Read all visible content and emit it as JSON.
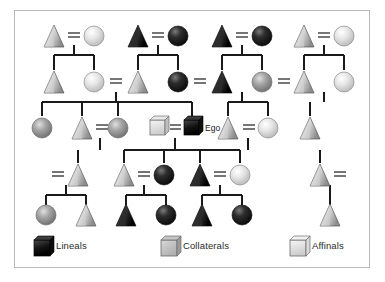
{
  "diagram": {
    "ego_label": "Ego",
    "frame": {
      "border_color": "#b9b9bd",
      "background": "#ffffff"
    },
    "palette": {
      "lineal": "#141414",
      "collateral": "#9a9a9a",
      "affinal": "#e2e2e2",
      "line": "#1a1a1a"
    },
    "symbols": {
      "male": "triangle",
      "female": "circle",
      "ego": "square"
    },
    "marriage_symbol": "=",
    "generations": [
      {
        "name": "generation-1",
        "y": 36,
        "nodes": [
          {
            "id": "g1-m1",
            "shape": "triangle",
            "fill": "collateral",
            "x": 54
          },
          {
            "id": "g1-f1",
            "shape": "circle",
            "fill": "affinal",
            "x": 94
          },
          {
            "id": "g1-m2",
            "shape": "triangle",
            "fill": "lineal",
            "x": 138
          },
          {
            "id": "g1-f2",
            "shape": "circle",
            "fill": "lineal",
            "x": 178
          },
          {
            "id": "g1-m3",
            "shape": "triangle",
            "fill": "lineal",
            "x": 222
          },
          {
            "id": "g1-f3",
            "shape": "circle",
            "fill": "lineal",
            "x": 262
          },
          {
            "id": "g1-m4",
            "shape": "triangle",
            "fill": "collateral",
            "x": 304
          },
          {
            "id": "g1-f4",
            "shape": "circle",
            "fill": "affinal",
            "x": 344
          }
        ],
        "marriages": [
          {
            "left": "g1-m1",
            "right": "g1-f1"
          },
          {
            "left": "g1-m2",
            "right": "g1-f2"
          },
          {
            "left": "g1-m3",
            "right": "g1-f3"
          },
          {
            "left": "g1-m4",
            "right": "g1-f4"
          }
        ]
      },
      {
        "name": "generation-2",
        "y": 82,
        "nodes": [
          {
            "id": "g2-m1",
            "shape": "triangle",
            "fill": "collateral",
            "x": 54
          },
          {
            "id": "g2-f1",
            "shape": "circle",
            "fill": "affinal",
            "x": 94
          },
          {
            "id": "g2-m2",
            "shape": "triangle",
            "fill": "collateral",
            "x": 138
          },
          {
            "id": "g2-f2",
            "shape": "circle",
            "fill": "lineal",
            "x": 178
          },
          {
            "id": "g2-m3",
            "shape": "triangle",
            "fill": "lineal",
            "x": 222
          },
          {
            "id": "g2-f3",
            "shape": "circle",
            "fill": "collateral",
            "x": 262
          },
          {
            "id": "g2-m4",
            "shape": "triangle",
            "fill": "collateral",
            "x": 304
          },
          {
            "id": "g2-f4",
            "shape": "circle",
            "fill": "affinal",
            "x": 344
          }
        ],
        "marriages": [
          {
            "left": "g2-f1",
            "right": "g2-m2"
          },
          {
            "left": "g2-f2",
            "right": "g2-m3"
          },
          {
            "left": "g2-f3",
            "right": "g2-m4"
          }
        ]
      },
      {
        "name": "generation-3",
        "y": 128,
        "nodes": [
          {
            "id": "g3-f1",
            "shape": "circle",
            "fill": "collateral",
            "x": 42
          },
          {
            "id": "g3-m1",
            "shape": "triangle",
            "fill": "collateral",
            "x": 82
          },
          {
            "id": "g3-f2",
            "shape": "circle",
            "fill": "collateral",
            "x": 118
          },
          {
            "id": "g3-spouse",
            "shape": "square",
            "fill": "affinal",
            "x": 158
          },
          {
            "id": "g3-ego",
            "shape": "square",
            "fill": "lineal",
            "x": 192
          },
          {
            "id": "g3-m2",
            "shape": "triangle",
            "fill": "collateral",
            "x": 228
          },
          {
            "id": "g3-f3",
            "shape": "circle",
            "fill": "affinal",
            "x": 268
          },
          {
            "id": "g3-m3",
            "shape": "triangle",
            "fill": "collateral",
            "x": 310
          }
        ],
        "marriages": [
          {
            "left": "g3-m1",
            "right": "g3-f2"
          },
          {
            "left": "g3-spouse",
            "right": "g3-ego"
          },
          {
            "left": "g3-m2",
            "right": "g3-f3"
          }
        ]
      },
      {
        "name": "generation-4",
        "y": 175,
        "nodes": [
          {
            "id": "g4-m1",
            "shape": "triangle",
            "fill": "collateral",
            "x": 78
          },
          {
            "id": "g4-m2",
            "shape": "triangle",
            "fill": "collateral",
            "x": 124
          },
          {
            "id": "g4-f1",
            "shape": "circle",
            "fill": "lineal",
            "x": 164
          },
          {
            "id": "g4-m3",
            "shape": "triangle",
            "fill": "lineal",
            "x": 200
          },
          {
            "id": "g4-f2",
            "shape": "circle",
            "fill": "affinal",
            "x": 240
          },
          {
            "id": "g4-m4",
            "shape": "triangle",
            "fill": "collateral",
            "x": 320
          }
        ],
        "marriages": [
          {
            "left": "g4-m1",
            "right": "g4-m1"
          },
          {
            "left": "g4-m2",
            "right": "g4-f1"
          },
          {
            "left": "g4-m3",
            "right": "g4-f2"
          }
        ]
      },
      {
        "name": "generation-5",
        "y": 215,
        "nodes": [
          {
            "id": "g5-f1",
            "shape": "circle",
            "fill": "collateral",
            "x": 46
          },
          {
            "id": "g5-m1",
            "shape": "triangle",
            "fill": "collateral",
            "x": 86
          },
          {
            "id": "g5-m2",
            "shape": "triangle",
            "fill": "lineal",
            "x": 126
          },
          {
            "id": "g5-f2",
            "shape": "circle",
            "fill": "lineal",
            "x": 166
          },
          {
            "id": "g5-m3",
            "shape": "triangle",
            "fill": "lineal",
            "x": 202
          },
          {
            "id": "g5-f3",
            "shape": "circle",
            "fill": "lineal",
            "x": 242
          },
          {
            "id": "g5-m4",
            "shape": "triangle",
            "fill": "collateral",
            "x": 330
          }
        ],
        "marriages": []
      }
    ]
  },
  "legend": {
    "items": [
      {
        "key": "lineals",
        "label": "Lineals",
        "swatch": "cube-black",
        "fill": "#141414"
      },
      {
        "key": "collaterals",
        "label": "Collaterals",
        "swatch": "cube-gray",
        "fill": "#9a9a9a"
      },
      {
        "key": "affinals",
        "label": "Affinals",
        "swatch": "cube-white",
        "fill": "#e8e8e8"
      }
    ]
  }
}
